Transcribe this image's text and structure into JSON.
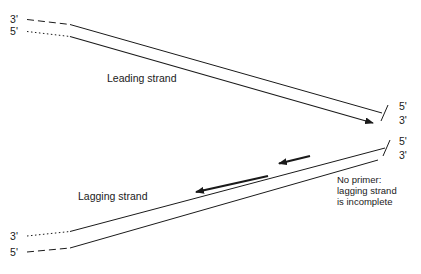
{
  "diagram": {
    "background_color": "#ffffff",
    "line_color": "#1a1a1a",
    "text_color": "#1a1a1a",
    "labels": {
      "leading_strand": "Leading strand",
      "lagging_strand": "Lagging strand",
      "note_line_1": "No primer:",
      "note_line_2": "lagging strand",
      "note_line_3": "is incomplete"
    },
    "ends": {
      "top_left_upper": "3'",
      "top_left_lower": "5'",
      "bottom_left_upper": "3'",
      "bottom_left_lower": "5'",
      "right_upper_pair_top": "5'",
      "right_upper_pair_bottom": "3'",
      "right_lower_pair_top": "5'",
      "right_lower_pair_bottom": "3'"
    }
  }
}
